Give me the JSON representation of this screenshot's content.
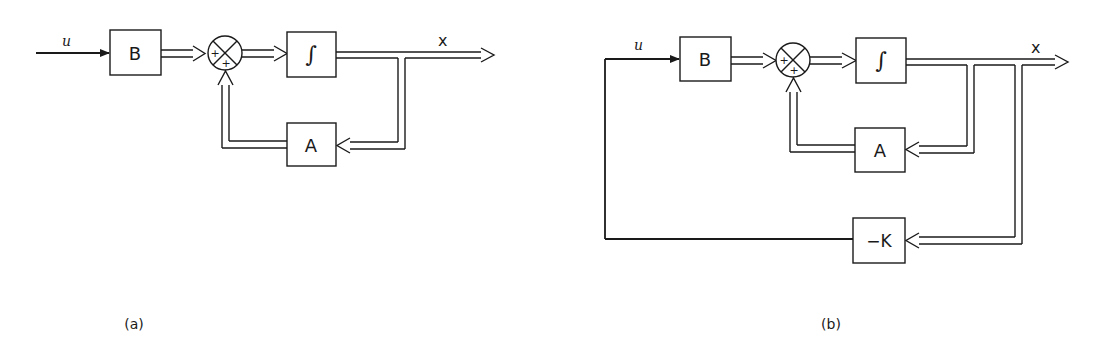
{
  "diagrams": [
    {
      "id": "a",
      "caption": "(a)",
      "input_label": "u",
      "output_label": "x",
      "blocks": {
        "input_gain": "B",
        "integrator": "∫",
        "feedback_gain": "A"
      },
      "summer_signs": [
        "+",
        "+"
      ]
    },
    {
      "id": "b",
      "caption": "(b)",
      "input_label": "u",
      "output_label": "x",
      "blocks": {
        "input_gain": "B",
        "integrator": "∫",
        "feedback_gain": "A",
        "state_feedback": "−K"
      },
      "summer_signs": [
        "+",
        "+"
      ]
    }
  ],
  "colors": {
    "stroke": "#1a1a1a",
    "background": "#ffffff"
  }
}
